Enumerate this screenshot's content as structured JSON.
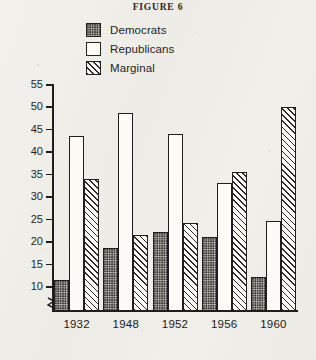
{
  "figure": {
    "title": "FIGURE 6"
  },
  "legend": {
    "items": [
      {
        "label": "Democrats",
        "pattern": "dotted-swatch-icon"
      },
      {
        "label": "Republicans",
        "pattern": "empty-swatch-icon"
      },
      {
        "label": "Marginal",
        "pattern": "hatched-swatch-icon"
      }
    ]
  },
  "axes": {
    "ylabel": "Numbers of Suburbs",
    "yticks": [
      10,
      15,
      20,
      25,
      30,
      35,
      40,
      45,
      50,
      55
    ],
    "ymin": 8,
    "ymax": 55,
    "axis_break": "axis-break-icon"
  },
  "chart_data": {
    "type": "bar",
    "title": "FIGURE 6",
    "xlabel": "",
    "ylabel": "Numbers of Suburbs",
    "categories": [
      "1932",
      "1948",
      "1952",
      "1956",
      "1960"
    ],
    "series": [
      {
        "name": "Democrats",
        "values": [
          15,
          22,
          25.5,
          24.5,
          15.5
        ]
      },
      {
        "name": "Republicans",
        "values": [
          47,
          52,
          47.5,
          36.5,
          28
        ]
      },
      {
        "name": "Marginal",
        "values": [
          37.5,
          25,
          27.5,
          39,
          53.5
        ]
      }
    ],
    "ylim": [
      8,
      55
    ],
    "ytick_step": 5,
    "grid": false,
    "legend_position": "top-center"
  }
}
